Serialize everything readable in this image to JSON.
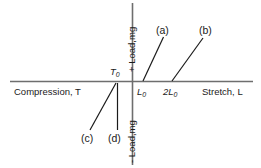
{
  "figure": {
    "type": "stress-strain-schematic",
    "width": 261,
    "height": 168,
    "axis_color": "#666666",
    "line_color": "#1a1a1a",
    "text_color": "#1a1a1a"
  },
  "axes": {
    "x_axis": {
      "left_label": "Compression,",
      "left_label_italic": "T",
      "right_label": "Stretch,",
      "right_label_italic": "L",
      "ticks": [
        {
          "base": "L",
          "sub": "0"
        },
        {
          "base": "2L",
          "sub": "0"
        }
      ],
      "origin_left_label": {
        "base": "T",
        "sub": "0"
      }
    },
    "y_axis": {
      "positive_label_prefix": "+ Load,",
      "positive_label_italic": "mg",
      "negative_label_prefix": "- Load,",
      "negative_label_italic": "mg"
    }
  },
  "curves": [
    {
      "id": "a",
      "label": "(a)",
      "x1": 143,
      "y1": 81,
      "x2": 163.5,
      "y2": 37
    },
    {
      "id": "b",
      "label": "(b)",
      "x1": 172,
      "y1": 81,
      "x2": 203,
      "y2": 38
    }
  ],
  "leaders": [
    {
      "id": "c",
      "label": "(c)",
      "x1": 90,
      "y1": 130,
      "x2": 116,
      "y2": 83
    },
    {
      "id": "d",
      "label": "(d)",
      "x1": 117,
      "y1": 130,
      "x2": 117,
      "y2": 83
    }
  ]
}
